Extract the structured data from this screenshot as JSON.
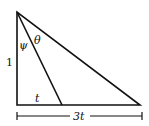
{
  "diagram": {
    "type": "right-triangle",
    "labels": {
      "left_side": "1",
      "angle_psi": "ψ",
      "angle_theta": "θ",
      "inner_base": "t",
      "full_base": "3t"
    },
    "colors": {
      "stroke": "#111111",
      "background": "#ffffff"
    }
  }
}
